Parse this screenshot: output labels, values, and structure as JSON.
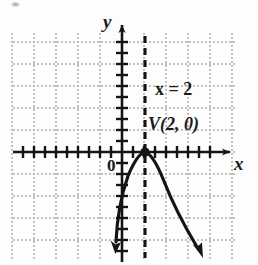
{
  "figure": {
    "kind": "coordinate-graph",
    "background_color": "#fdfdfd",
    "ink_color": "#141414",
    "grid_color": "#b4b4b4"
  },
  "axes": {
    "x_label": "x",
    "y_label": "y",
    "origin_label": "0",
    "x_axis_y_px": 152,
    "y_axis_x_px": 122,
    "tick_spacing_px": 11,
    "grid_spacing_px": 22,
    "grid_left_px": 13,
    "grid_right_px": 234,
    "grid_top_px": 33,
    "grid_bottom_px": 258
  },
  "annotations": {
    "axis_of_symmetry_label": "x = 2",
    "axis_of_symmetry_x": 2,
    "vertex_label": "V(2, 0)",
    "vertex_point": [
      2,
      0
    ]
  },
  "chart_data": {
    "type": "line",
    "title": "",
    "xlabel": "x",
    "ylabel": "y",
    "grid": true,
    "legend": "none",
    "xlim": [
      -10,
      10
    ],
    "ylim": [
      -11,
      11
    ],
    "curve": {
      "name": "parabola",
      "equation": "y = -a(x - 2)^2",
      "opens": "down",
      "vertex": [
        2,
        0
      ],
      "arrow_ends": "both",
      "x": [
        -1,
        0,
        1,
        2,
        3,
        4,
        5,
        6
      ],
      "y": [
        -9,
        -4,
        -1,
        0,
        -1,
        -4,
        -9,
        -16
      ]
    },
    "vertical_line": {
      "name": "axis-of-symmetry",
      "style": "dashed",
      "x": 2
    },
    "points": [
      {
        "label": "V(2, 0)",
        "x": 2,
        "y": 0,
        "marker": "filled-circle"
      }
    ],
    "annotations": [
      {
        "text": "x = 2",
        "x": 3.6,
        "y": 5.3
      },
      {
        "text": "V(2, 0)",
        "x": 2.3,
        "y": 2.4
      }
    ]
  }
}
